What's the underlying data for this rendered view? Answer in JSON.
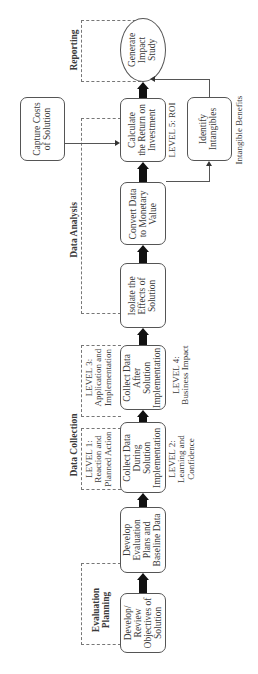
{
  "sections": {
    "evaluation_planning": "Evaluation\nPlanning",
    "data_collection": "Data Collection",
    "data_analysis": "Data Analysis",
    "reporting": "Reporting"
  },
  "steps": [
    {
      "id": "objectives",
      "label": "Develop/\nReview\nObjectives of\nSolution"
    },
    {
      "id": "plans",
      "label": "Develop\nEvaluation\nPlans and\nBaseline Data"
    },
    {
      "id": "collect-during",
      "label": "Collect Data\nDuring\nSolution\nImplementation"
    },
    {
      "id": "collect-after",
      "label": "Collect Data\nAfter\nSolution\nImplementation"
    },
    {
      "id": "isolate",
      "label": "Isolate the\nEffects of\nSolution"
    },
    {
      "id": "convert",
      "label": "Convert Data\nto Monetary\nValue"
    },
    {
      "id": "roi",
      "label": "Calculate\nthe Return on\nInvestment"
    },
    {
      "id": "impact",
      "label": "Generate\nImpact\nStudy"
    }
  ],
  "side_boxes": {
    "capture_costs": "Capture Costs\nof Solution",
    "identify_intangibles": "Identify\nIntangibles"
  },
  "levels": {
    "level1": "LEVEL 1:\nReaction and\nPlanned Action",
    "level2": "LEVEL 2:\nLearning and\nConfidence",
    "level3": "LEVEL 3:\nApplication and\nImplementation",
    "level4": "LEVEL 4:\nBusiness Impact",
    "level5": "LEVEL 5: ROI"
  },
  "annotations": {
    "intangible_benefits": "Intangible Benefits"
  }
}
